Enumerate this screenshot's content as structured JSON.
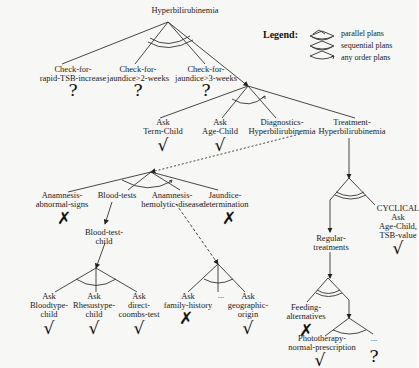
{
  "diagram": {
    "root": "Hyperbilirubinemia",
    "legend": {
      "title": "Legend:",
      "items": [
        {
          "symbol": "parallel-plans-icon",
          "label": "parallel plans"
        },
        {
          "symbol": "sequential-plans-icon",
          "label": "sequential plans"
        },
        {
          "symbol": "any-order-plans-icon",
          "label": "any order plans"
        }
      ]
    },
    "nodes": {
      "check_rapid": {
        "label": "Check-for-\nrapid-TSB-increase",
        "mark": "?"
      },
      "check_2w": {
        "label": "Check-for-\njaundice>2-weeks",
        "mark": "?"
      },
      "check_3w": {
        "label": "Check-for-\njaundice>3-weeks",
        "mark": "?"
      },
      "ask_term": {
        "label": "Ask\nTerm-Child",
        "mark": "√"
      },
      "ask_age": {
        "label": "Ask\nAge-Child",
        "mark": "√"
      },
      "diagnostics": {
        "label": "Diagnostics-\nHyperbilirubinemia"
      },
      "treatment": {
        "label": "Treatment-\nHyperbilirubinemia"
      },
      "anam_abnormal": {
        "label": "Anamnesis-\nabnormal-signs",
        "mark": "✗"
      },
      "blood_tests": {
        "label": "Blood-tests"
      },
      "anam_hemolytic": {
        "label": "Anamnesis-\nhemolytic-disease"
      },
      "jaundice_det": {
        "label": "Jaundice-\ndetermination",
        "mark": "✗"
      },
      "blood_test_child": {
        "label": "Blood-test-\nchild"
      },
      "ask_bloodtype": {
        "label": "Ask\nBloodtype-\nchild",
        "mark": "√"
      },
      "ask_rhesus": {
        "label": "Ask\nRhesustype-\nchild",
        "mark": "√"
      },
      "ask_coombs": {
        "label": "Ask\ndirect-\ncoombs-test",
        "mark": "√"
      },
      "ask_family": {
        "label": "Ask\nfamily-history",
        "mark": "✗"
      },
      "ellipsis_family": {
        "label": "..."
      },
      "ask_geo": {
        "label": "Ask\ngeographic-\norigin",
        "mark": "√"
      },
      "regular_treatments": {
        "label": "Regular-\ntreatments"
      },
      "cyclical": {
        "label": "CYCLICAL\nAsk\nAge-Child,\nTSB-value",
        "mark": "√"
      },
      "feeding": {
        "label": "Feeding-\nalternatives",
        "mark": "✗"
      },
      "phototherapy": {
        "label": "Phototherapy-\nnormal-prescription",
        "mark": "√"
      },
      "ellipsis_treat": {
        "label": "...",
        "mark": "?"
      }
    }
  }
}
